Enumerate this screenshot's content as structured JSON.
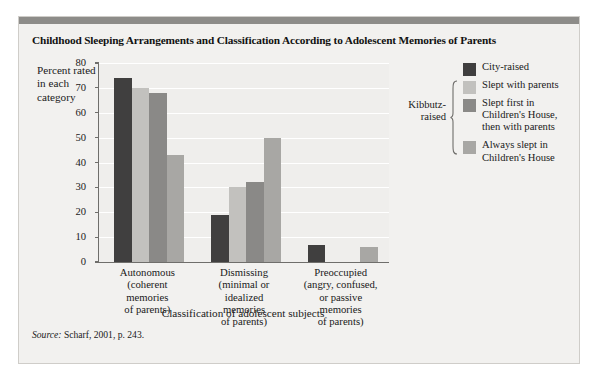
{
  "figure": {
    "title": "Childhood Sleeping Arrangements and Classification According to Adolescent Memories of Parents",
    "source_prefix": "Source:",
    "source_text": "Scharf, 2001, p. 243."
  },
  "chart_data": {
    "type": "bar",
    "title": "Childhood Sleeping Arrangements and Classification According to Adolescent Memories of Parents",
    "xlabel": "Classification of adolescent subjects",
    "ylabel": "Percent rated in each category",
    "ylim": [
      0,
      80
    ],
    "yticks": [
      0,
      10,
      20,
      30,
      40,
      50,
      60,
      70,
      80
    ],
    "grid": true,
    "legend_position": "right",
    "categories": [
      "Autonomous (coherent memories of parents)",
      "Dismissing (minimal or idealized memories of parents)",
      "Preoccupied (angry, confused, or passive memories of parents)"
    ],
    "category_lines": [
      [
        "Autonomous",
        "(coherent",
        "memories",
        "of parents)"
      ],
      [
        "Dismissing",
        "(minimal or",
        "idealized",
        "memories",
        "of parents)"
      ],
      [
        "Preoccupied",
        "(angry, confused,",
        "or passive",
        "memories",
        "of parents)"
      ]
    ],
    "series": [
      {
        "name": "City-raised",
        "color": "#403f3f",
        "values": [
          74,
          19,
          7
        ]
      },
      {
        "name": "Slept with parents",
        "color": "#c2c1be",
        "values": [
          70,
          30,
          0
        ]
      },
      {
        "name": "Slept first in Children's House, then with parents",
        "color": "#8a8987",
        "values": [
          68,
          32,
          0
        ]
      },
      {
        "name": "Always slept in Children's House",
        "color": "#a8a7a4",
        "values": [
          43,
          50,
          6
        ]
      }
    ]
  },
  "legend": {
    "bracket_label": "Kibbutz-raised",
    "bracket_lines": [
      "Kibbutz-",
      "raised"
    ],
    "items": [
      {
        "label": "City-raised",
        "lines": [
          "City-raised"
        ],
        "color": "#403f3f"
      },
      {
        "label": "Slept with parents",
        "lines": [
          "Slept with parents"
        ],
        "color": "#c2c1be"
      },
      {
        "label": "Slept first in Children's House, then with parents",
        "lines": [
          "Slept first in",
          "Children's House,",
          "then with parents"
        ],
        "color": "#8a8987"
      },
      {
        "label": "Always slept in Children's House",
        "lines": [
          "Always slept in",
          "Children's House"
        ],
        "color": "#a8a7a4"
      }
    ]
  },
  "colors": {
    "panel_background": "#f2f1ef",
    "plot_background": "#efeeec",
    "top_bar": "#8d8c89",
    "axis": "#6f6e6b",
    "gridline": "#ffffff"
  }
}
